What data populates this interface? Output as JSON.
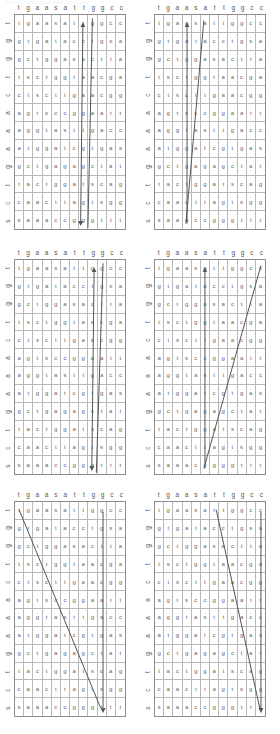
{
  "caption": "Figure: alignment path matrices",
  "alphabet": [
    "a",
    "c",
    "g",
    "t",
    "s"
  ],
  "line_color": "#555555",
  "grid_color": "#b8b8b8",
  "border_color": "#8c8c8c",
  "text_color": "#666666",
  "grid_size": {
    "rows": 12,
    "cols": 12
  },
  "panels": [
    {
      "name": "panel-1",
      "col_labels": [
        "t",
        "g",
        "a",
        "a",
        "s",
        "a",
        "t",
        "t",
        "g",
        "g",
        "c",
        "c"
      ],
      "row_labels": [
        "t",
        "g",
        "g",
        "t",
        "c",
        "a",
        "a",
        "a",
        "g",
        "t",
        "c",
        "s"
      ],
      "cells": [
        [
          "t",
          "g",
          "a",
          "a",
          "s",
          "a",
          "t",
          "t",
          "g",
          "g",
          "c",
          "c"
        ],
        [
          "g",
          "t",
          "g",
          "a",
          "t",
          "a",
          "c",
          "c",
          "t",
          "g",
          "s",
          "a"
        ],
        [
          "g",
          "c",
          "t",
          "g",
          "g",
          "a",
          "s",
          "a",
          "c",
          "t",
          "t",
          "a"
        ],
        [
          "t",
          "s",
          "c",
          "t",
          "g",
          "g",
          "t",
          "a",
          "a",
          "c",
          "g",
          "a"
        ],
        [
          "c",
          "t",
          "s",
          "c",
          "t",
          "t",
          "g",
          "a",
          "a",
          "c",
          "g",
          "g"
        ],
        [
          "a",
          "g",
          "t",
          "s",
          "c",
          "c",
          "g",
          "g",
          "a",
          "a",
          "t",
          "t"
        ],
        [
          "a",
          "g",
          "g",
          "t",
          "a",
          "s",
          "t",
          "t",
          "g",
          "a",
          "c",
          "c"
        ],
        [
          "a",
          "t",
          "g",
          "g",
          "a",
          "t",
          "c",
          "g",
          "t",
          "g",
          "a",
          "s"
        ],
        [
          "g",
          "c",
          "t",
          "g",
          "a",
          "g",
          "a",
          "g",
          "c",
          "t",
          "a",
          "t"
        ],
        [
          "t",
          "a",
          "c",
          "t",
          "g",
          "g",
          "a",
          "t",
          "s",
          "c",
          "a",
          "g"
        ],
        [
          "c",
          "a",
          "a",
          "c",
          "t",
          "t",
          "a",
          "g",
          "t",
          "s",
          "g",
          "g"
        ],
        [
          "s",
          "a",
          "a",
          "a",
          "c",
          "c",
          "g",
          "g",
          "g",
          "t",
          "t",
          "t"
        ]
      ],
      "annotations": [
        {
          "type": "arrow-double",
          "x1": 0.615,
          "y1": 0.05,
          "x2": 0.595,
          "y2": 0.97
        },
        {
          "type": "line",
          "x1": 0.7,
          "y1": 0.02,
          "x2": 0.66,
          "y2": 0.99
        }
      ]
    },
    {
      "name": "panel-2",
      "col_labels": [
        "t",
        "g",
        "a",
        "a",
        "s",
        "a",
        "t",
        "t",
        "g",
        "g",
        "c",
        "c"
      ],
      "row_labels": [
        "t",
        "g",
        "g",
        "t",
        "c",
        "a",
        "a",
        "a",
        "g",
        "t",
        "c",
        "s"
      ],
      "cells": [
        [
          "t",
          "g",
          "a",
          "a",
          "s",
          "a",
          "t",
          "t",
          "g",
          "g",
          "c",
          "c"
        ],
        [
          "g",
          "t",
          "g",
          "a",
          "t",
          "a",
          "c",
          "c",
          "t",
          "g",
          "s",
          "a"
        ],
        [
          "g",
          "c",
          "t",
          "g",
          "g",
          "a",
          "s",
          "a",
          "c",
          "t",
          "t",
          "a"
        ],
        [
          "t",
          "s",
          "c",
          "t",
          "g",
          "g",
          "t",
          "a",
          "a",
          "c",
          "g",
          "a"
        ],
        [
          "c",
          "t",
          "s",
          "c",
          "t",
          "t",
          "g",
          "a",
          "a",
          "c",
          "g",
          "g"
        ],
        [
          "a",
          "g",
          "t",
          "s",
          "c",
          "c",
          "g",
          "g",
          "a",
          "a",
          "t",
          "t"
        ],
        [
          "a",
          "g",
          "g",
          "t",
          "a",
          "s",
          "t",
          "t",
          "g",
          "a",
          "c",
          "c"
        ],
        [
          "a",
          "t",
          "g",
          "g",
          "a",
          "t",
          "c",
          "g",
          "t",
          "g",
          "a",
          "s"
        ],
        [
          "g",
          "c",
          "t",
          "g",
          "a",
          "g",
          "a",
          "g",
          "c",
          "t",
          "a",
          "t"
        ],
        [
          "t",
          "a",
          "c",
          "t",
          "g",
          "g",
          "a",
          "t",
          "s",
          "c",
          "a",
          "g"
        ],
        [
          "c",
          "a",
          "a",
          "c",
          "t",
          "t",
          "a",
          "g",
          "t",
          "s",
          "g",
          "g"
        ],
        [
          "s",
          "a",
          "a",
          "a",
          "c",
          "c",
          "g",
          "g",
          "g",
          "t",
          "t",
          "t"
        ]
      ],
      "annotations": [
        {
          "type": "arrow-up",
          "x1": 0.295,
          "y1": 0.97,
          "x2": 0.295,
          "y2": 0.05
        },
        {
          "type": "line",
          "x1": 0.445,
          "y1": 0.03,
          "x2": 0.285,
          "y2": 0.97
        }
      ]
    },
    {
      "name": "panel-3",
      "col_labels": [
        "t",
        "g",
        "a",
        "a",
        "s",
        "a",
        "t",
        "t",
        "g",
        "g",
        "c",
        "c"
      ],
      "row_labels": [
        "t",
        "g",
        "g",
        "t",
        "c",
        "a",
        "a",
        "a",
        "g",
        "t",
        "c",
        "s"
      ],
      "cells": [
        [
          "t",
          "g",
          "a",
          "a",
          "s",
          "a",
          "t",
          "t",
          "g",
          "g",
          "c",
          "c"
        ],
        [
          "g",
          "t",
          "g",
          "a",
          "t",
          "a",
          "c",
          "c",
          "t",
          "g",
          "s",
          "a"
        ],
        [
          "g",
          "c",
          "t",
          "g",
          "g",
          "a",
          "s",
          "a",
          "c",
          "t",
          "t",
          "a"
        ],
        [
          "t",
          "s",
          "c",
          "t",
          "g",
          "g",
          "t",
          "a",
          "a",
          "c",
          "g",
          "a"
        ],
        [
          "c",
          "t",
          "s",
          "c",
          "t",
          "t",
          "g",
          "a",
          "a",
          "c",
          "g",
          "g"
        ],
        [
          "a",
          "g",
          "t",
          "s",
          "c",
          "c",
          "g",
          "g",
          "a",
          "a",
          "t",
          "t"
        ],
        [
          "a",
          "g",
          "g",
          "t",
          "a",
          "s",
          "t",
          "t",
          "g",
          "a",
          "c",
          "c"
        ],
        [
          "a",
          "t",
          "g",
          "g",
          "a",
          "t",
          "c",
          "g",
          "t",
          "g",
          "a",
          "s"
        ],
        [
          "g",
          "c",
          "t",
          "g",
          "a",
          "g",
          "a",
          "g",
          "c",
          "t",
          "a",
          "t"
        ],
        [
          "t",
          "a",
          "c",
          "t",
          "g",
          "g",
          "a",
          "t",
          "s",
          "c",
          "a",
          "g"
        ],
        [
          "c",
          "a",
          "a",
          "c",
          "t",
          "t",
          "a",
          "g",
          "t",
          "s",
          "g",
          "g"
        ],
        [
          "s",
          "a",
          "a",
          "a",
          "c",
          "c",
          "g",
          "g",
          "g",
          "t",
          "t",
          "t"
        ]
      ],
      "annotations": [
        {
          "type": "arrow-double",
          "x1": 0.715,
          "y1": 0.05,
          "x2": 0.695,
          "y2": 0.97
        },
        {
          "type": "line",
          "x1": 0.795,
          "y1": 0.02,
          "x2": 0.735,
          "y2": 0.99
        }
      ]
    },
    {
      "name": "panel-4",
      "col_labels": [
        "t",
        "g",
        "a",
        "a",
        "s",
        "a",
        "t",
        "t",
        "g",
        "g",
        "c",
        "c"
      ],
      "row_labels": [
        "t",
        "g",
        "g",
        "t",
        "c",
        "a",
        "a",
        "a",
        "g",
        "t",
        "c",
        "s"
      ],
      "cells": [
        [
          "t",
          "g",
          "a",
          "a",
          "s",
          "a",
          "t",
          "t",
          "g",
          "g",
          "c",
          "c"
        ],
        [
          "g",
          "t",
          "g",
          "a",
          "t",
          "a",
          "c",
          "c",
          "t",
          "g",
          "s",
          "a"
        ],
        [
          "g",
          "c",
          "t",
          "g",
          "g",
          "a",
          "s",
          "a",
          "c",
          "t",
          "t",
          "a"
        ],
        [
          "t",
          "s",
          "c",
          "t",
          "g",
          "g",
          "t",
          "a",
          "a",
          "c",
          "g",
          "a"
        ],
        [
          "c",
          "t",
          "s",
          "c",
          "t",
          "t",
          "g",
          "a",
          "a",
          "c",
          "g",
          "g"
        ],
        [
          "a",
          "g",
          "t",
          "s",
          "c",
          "c",
          "g",
          "g",
          "a",
          "a",
          "t",
          "t"
        ],
        [
          "a",
          "g",
          "g",
          "t",
          "a",
          "s",
          "t",
          "t",
          "g",
          "a",
          "c",
          "c"
        ],
        [
          "a",
          "t",
          "g",
          "g",
          "a",
          "t",
          "c",
          "g",
          "t",
          "g",
          "a",
          "s"
        ],
        [
          "g",
          "c",
          "t",
          "g",
          "a",
          "g",
          "a",
          "g",
          "c",
          "t",
          "a",
          "t"
        ],
        [
          "t",
          "a",
          "c",
          "t",
          "g",
          "g",
          "a",
          "t",
          "s",
          "c",
          "a",
          "g"
        ],
        [
          "c",
          "a",
          "a",
          "c",
          "t",
          "t",
          "a",
          "g",
          "t",
          "s",
          "g",
          "g"
        ],
        [
          "s",
          "a",
          "a",
          "a",
          "c",
          "c",
          "g",
          "g",
          "g",
          "t",
          "t",
          "t"
        ]
      ],
      "annotations": [
        {
          "type": "arrow-up",
          "x1": 0.455,
          "y1": 0.97,
          "x2": 0.455,
          "y2": 0.05
        },
        {
          "type": "line",
          "x1": 0.955,
          "y1": 0.03,
          "x2": 0.445,
          "y2": 0.97
        }
      ]
    },
    {
      "name": "panel-5",
      "col_labels": [
        "t",
        "g",
        "a",
        "a",
        "s",
        "a",
        "t",
        "t",
        "g",
        "g",
        "c",
        "c"
      ],
      "row_labels": [
        "t",
        "g",
        "g",
        "t",
        "c",
        "a",
        "a",
        "a",
        "g",
        "t",
        "c",
        "s"
      ],
      "cells": [
        [
          "t",
          "g",
          "a",
          "a",
          "s",
          "a",
          "t",
          "t",
          "g",
          "g",
          "c",
          "c"
        ],
        [
          "g",
          "t",
          "g",
          "a",
          "t",
          "a",
          "c",
          "c",
          "t",
          "g",
          "s",
          "a"
        ],
        [
          "g",
          "c",
          "t",
          "g",
          "g",
          "a",
          "s",
          "a",
          "c",
          "t",
          "t",
          "a"
        ],
        [
          "t",
          "s",
          "c",
          "t",
          "g",
          "g",
          "t",
          "a",
          "a",
          "c",
          "g",
          "a"
        ],
        [
          "c",
          "t",
          "s",
          "c",
          "t",
          "t",
          "g",
          "a",
          "a",
          "c",
          "g",
          "g"
        ],
        [
          "a",
          "g",
          "t",
          "s",
          "c",
          "c",
          "g",
          "g",
          "a",
          "a",
          "t",
          "t"
        ],
        [
          "a",
          "g",
          "g",
          "t",
          "a",
          "s",
          "t",
          "t",
          "g",
          "a",
          "c",
          "c"
        ],
        [
          "a",
          "t",
          "g",
          "g",
          "a",
          "t",
          "c",
          "g",
          "t",
          "g",
          "a",
          "s"
        ],
        [
          "g",
          "c",
          "t",
          "g",
          "a",
          "g",
          "a",
          "g",
          "c",
          "t",
          "a",
          "t"
        ],
        [
          "t",
          "a",
          "c",
          "t",
          "g",
          "g",
          "a",
          "t",
          "s",
          "c",
          "a",
          "g"
        ],
        [
          "c",
          "a",
          "a",
          "c",
          "t",
          "t",
          "a",
          "g",
          "t",
          "s",
          "g",
          "g"
        ],
        [
          "s",
          "a",
          "a",
          "a",
          "c",
          "c",
          "g",
          "g",
          "g",
          "t",
          "t",
          "t"
        ]
      ],
      "annotations": [
        {
          "type": "arrow-down",
          "x1": 0.795,
          "y1": 0.05,
          "x2": 0.795,
          "y2": 0.97
        },
        {
          "type": "line",
          "x1": 0.045,
          "y1": 0.04,
          "x2": 0.775,
          "y2": 0.96
        }
      ]
    },
    {
      "name": "panel-6",
      "col_labels": [
        "t",
        "g",
        "a",
        "a",
        "s",
        "a",
        "t",
        "t",
        "g",
        "g",
        "c",
        "c"
      ],
      "row_labels": [
        "t",
        "g",
        "g",
        "t",
        "c",
        "a",
        "a",
        "a",
        "g",
        "t",
        "c",
        "s"
      ],
      "cells": [
        [
          "t",
          "g",
          "a",
          "a",
          "s",
          "a",
          "t",
          "t",
          "g",
          "g",
          "c",
          "c"
        ],
        [
          "g",
          "t",
          "g",
          "a",
          "t",
          "a",
          "c",
          "c",
          "t",
          "g",
          "s",
          "a"
        ],
        [
          "g",
          "c",
          "t",
          "g",
          "g",
          "a",
          "s",
          "a",
          "c",
          "t",
          "t",
          "a"
        ],
        [
          "t",
          "s",
          "c",
          "t",
          "g",
          "g",
          "t",
          "a",
          "a",
          "c",
          "g",
          "a"
        ],
        [
          "c",
          "t",
          "s",
          "c",
          "t",
          "t",
          "g",
          "a",
          "a",
          "c",
          "g",
          "g"
        ],
        [
          "a",
          "g",
          "t",
          "s",
          "c",
          "c",
          "g",
          "g",
          "a",
          "a",
          "t",
          "t"
        ],
        [
          "a",
          "g",
          "g",
          "t",
          "a",
          "s",
          "t",
          "t",
          "g",
          "a",
          "c",
          "c"
        ],
        [
          "a",
          "t",
          "g",
          "g",
          "a",
          "t",
          "c",
          "g",
          "t",
          "g",
          "a",
          "s"
        ],
        [
          "g",
          "c",
          "t",
          "g",
          "a",
          "g",
          "a",
          "g",
          "c",
          "t",
          "a",
          "t"
        ],
        [
          "t",
          "a",
          "c",
          "t",
          "g",
          "g",
          "a",
          "t",
          "s",
          "c",
          "a",
          "g"
        ],
        [
          "c",
          "a",
          "a",
          "c",
          "t",
          "t",
          "a",
          "g",
          "t",
          "s",
          "g",
          "g"
        ],
        [
          "s",
          "a",
          "a",
          "a",
          "c",
          "c",
          "g",
          "g",
          "g",
          "t",
          "t",
          "t"
        ]
      ],
      "annotations": [
        {
          "type": "arrow-down",
          "x1": 0.955,
          "y1": 0.05,
          "x2": 0.955,
          "y2": 0.97
        },
        {
          "type": "line",
          "x1": 0.555,
          "y1": 0.04,
          "x2": 0.945,
          "y2": 0.96
        }
      ]
    }
  ]
}
